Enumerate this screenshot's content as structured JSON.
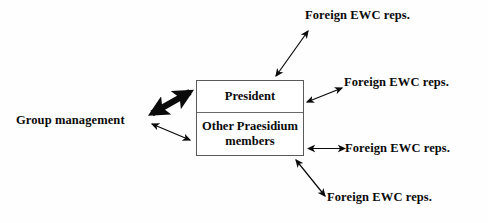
{
  "diagram": {
    "background_color": "#fefefe",
    "ink_color": "#0a0a0a",
    "box_border_color": "#5a5a5a",
    "central_box": {
      "name": "praesidium-box",
      "cells": [
        {
          "id": "president",
          "label": "President"
        },
        {
          "id": "other-praesidium-members",
          "label": "Other Praesidium members"
        }
      ]
    },
    "nodes": [
      {
        "id": "group-management",
        "label": "Group management",
        "position": "left"
      },
      {
        "id": "foreign-ewc-reps-1",
        "label": "Foreign EWC reps.",
        "position": "top-right"
      },
      {
        "id": "foreign-ewc-reps-2",
        "label": "Foreign EWC reps.",
        "position": "upper-right"
      },
      {
        "id": "foreign-ewc-reps-3",
        "label": "Foreign EWC reps.",
        "position": "lower-right"
      },
      {
        "id": "foreign-ewc-reps-4",
        "label": "Foreign EWC reps.",
        "position": "bottom-right"
      }
    ],
    "connectors": [
      {
        "id": "group-management-to-president",
        "from": "group-management",
        "to": "president",
        "style": "thick",
        "arrowheads": "both",
        "weight": 6
      },
      {
        "id": "group-management-to-praesidium",
        "from": "group-management",
        "to": "other-praesidium-members",
        "style": "thin",
        "arrowheads": "both",
        "weight": 1.2
      },
      {
        "id": "box-to-foreign-ewc-reps-1",
        "from": "praesidium-box",
        "to": "foreign-ewc-reps-1",
        "style": "thin",
        "arrowheads": "both",
        "weight": 1.2
      },
      {
        "id": "box-to-foreign-ewc-reps-2",
        "from": "praesidium-box",
        "to": "foreign-ewc-reps-2",
        "style": "thin",
        "arrowheads": "both",
        "weight": 1.2
      },
      {
        "id": "box-to-foreign-ewc-reps-3",
        "from": "praesidium-box",
        "to": "foreign-ewc-reps-3",
        "style": "thin",
        "arrowheads": "both",
        "weight": 1.2
      },
      {
        "id": "box-to-foreign-ewc-reps-4",
        "from": "praesidium-box",
        "to": "foreign-ewc-reps-4",
        "style": "thin",
        "arrowheads": "both",
        "weight": 1.2
      }
    ]
  }
}
